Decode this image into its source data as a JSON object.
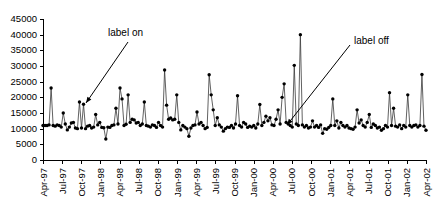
{
  "chart_data": {
    "type": "line",
    "title": "",
    "xlabel": "",
    "ylabel": "",
    "ylim": [
      0,
      45000
    ],
    "ytick_values": [
      0,
      5000,
      10000,
      15000,
      20000,
      25000,
      30000,
      35000,
      40000,
      45000
    ],
    "ytick_labels": [
      "0",
      "5000",
      "10000",
      "15000",
      "20000",
      "25000",
      "30000",
      "35000",
      "40000",
      "45000"
    ],
    "grid": false,
    "legend": "none",
    "xtick_labels": [
      "Apr-97",
      "Jul-97",
      "Oct-97",
      "Jan-98",
      "Apr-98",
      "Jul-98",
      "Oct-98",
      "Jan-99",
      "Apr-99",
      "Jul-99",
      "Oct-99",
      "Jan-00",
      "Apr-00",
      "Jul-00",
      "Oct-00",
      "Jan-01",
      "Apr-01",
      "Jul-01",
      "Oct-01",
      "Jan-02",
      "Apr-02"
    ],
    "xlim_labels": [
      "Apr-97",
      "Apr-02"
    ],
    "marker": "filled-circle",
    "series": [
      {
        "name": "weekly series",
        "values": [
          11000,
          11000,
          11000,
          11200,
          23000,
          11000,
          10800,
          11200,
          11000,
          10500,
          15000,
          11500,
          9600,
          10500,
          11800,
          12000,
          10200,
          10000,
          18500,
          10200,
          17800,
          10000,
          10800,
          11000,
          10200,
          10500,
          14500,
          11200,
          12000,
          10400,
          10300,
          6700,
          10500,
          10400,
          11000,
          11200,
          16500,
          11500,
          23000,
          19500,
          11000,
          11400,
          20800,
          12000,
          13000,
          12800,
          11800,
          12000,
          11000,
          11500,
          18500,
          11000,
          10800,
          10500,
          11200,
          11000,
          10400,
          12000,
          11000,
          10500,
          28700,
          17500,
          13000,
          13400,
          12800,
          13000,
          20800,
          12000,
          9600,
          11000,
          10500,
          10000,
          7600,
          10200,
          11000,
          11200,
          15300,
          11500,
          12000,
          11000,
          10000,
          10400,
          27200,
          20800,
          16000,
          11000,
          13500,
          11200,
          10500,
          9200,
          10000,
          10500,
          10400,
          11000,
          10200,
          11500,
          20500,
          11000,
          10500,
          12000,
          11500,
          10400,
          10800,
          10500,
          11000,
          10200,
          11500,
          17700,
          11000,
          12000,
          14000,
          12500,
          13500,
          11200,
          11000,
          13000,
          16000,
          11500,
          20000,
          24300,
          12000,
          11500,
          11000,
          10500,
          30200,
          11500,
          11000,
          40000,
          11200,
          10500,
          11000,
          10200,
          10500,
          12500,
          10500,
          11000,
          10400,
          11200,
          8500,
          10000,
          9800,
          10400,
          11000,
          19500,
          11000,
          12500,
          10200,
          12000,
          11000,
          10500,
          11000,
          10200,
          10000,
          9800,
          10500,
          16000,
          11800,
          12800,
          11000,
          10500,
          12000,
          14500,
          10400,
          11500,
          11000,
          10200,
          10500,
          9500,
          10000,
          11000,
          10500,
          21500,
          11000,
          16500,
          10800,
          10500,
          11200,
          10000,
          11000,
          10500,
          20800,
          11000,
          10500,
          11000,
          11200,
          10500,
          11000,
          27300,
          10800,
          9500
        ]
      }
    ],
    "annotations": [
      {
        "text": "label on",
        "text_x": 108,
        "text_y": 33,
        "arrow_from_x": 128,
        "arrow_from_y": 42,
        "arrow_to_x": 86,
        "arrow_to_y": 103
      },
      {
        "text": "label off",
        "text_x": 354,
        "text_y": 41,
        "arrow_from_x": 350,
        "arrow_from_y": 45,
        "arrow_to_x": 287,
        "arrow_to_y": 125
      }
    ]
  },
  "axes": {
    "plot_left": 43,
    "plot_right": 426,
    "plot_top": 19,
    "plot_bottom": 160
  }
}
